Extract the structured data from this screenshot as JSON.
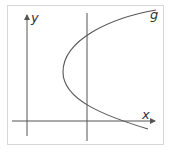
{
  "figure": {
    "labels": {
      "y_axis": "y",
      "x_axis": "x",
      "curve": "g"
    },
    "colors": {
      "axis": "#555555",
      "curve": "#555555",
      "frame": "#d6d6d6",
      "text": "#333333"
    },
    "curve_type": "parabola opening right"
  }
}
